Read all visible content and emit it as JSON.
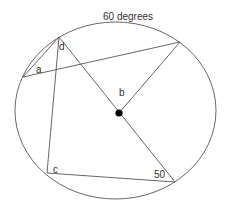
{
  "diagram": {
    "type": "circle-geometry",
    "labels": {
      "title_angle": "60 degrees",
      "a": "a",
      "b": "b",
      "c": "c",
      "d": "d",
      "angle_50": "50"
    },
    "colors": {
      "line": "#555555",
      "dot": "#000000",
      "text": "#333333",
      "background": "#ffffff"
    }
  }
}
